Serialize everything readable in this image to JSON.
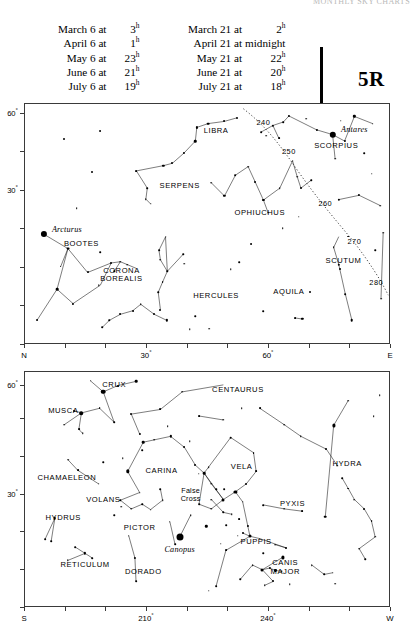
{
  "running_head": "MONTHLY SKY CHARTS",
  "chart_code": "5R",
  "header": {
    "left_column": [
      {
        "label": "March 6 at",
        "value": "3",
        "sup": "h"
      },
      {
        "label": "April 6 at",
        "value": "1",
        "sup": "h"
      },
      {
        "label": "May 6 at",
        "value": "23",
        "sup": "h"
      },
      {
        "label": "June 6 at",
        "value": "21",
        "sup": "h"
      },
      {
        "label": "July 6 at",
        "value": "19",
        "sup": "h"
      }
    ],
    "right_column": [
      {
        "label": "March 21 at",
        "value": "2",
        "sup": "h"
      },
      {
        "label": "April 21 at",
        "value": "midnight",
        "sup": ""
      },
      {
        "label": "May 21 at",
        "value": "22",
        "sup": "h"
      },
      {
        "label": "June 21 at",
        "value": "20",
        "sup": "h"
      },
      {
        "label": "July 21 at",
        "value": "18",
        "sup": "h"
      }
    ]
  },
  "panels": [
    {
      "id": "north",
      "name": "northern-horizon-chart",
      "x_axis": {
        "ticks": [
          {
            "pos": 0.0,
            "label": "N"
          },
          {
            "pos": 0.1111,
            "label": ""
          },
          {
            "pos": 0.2222,
            "label": ""
          },
          {
            "pos": 0.3333,
            "label": "30°"
          },
          {
            "pos": 0.4444,
            "label": ""
          },
          {
            "pos": 0.5555,
            "label": ""
          },
          {
            "pos": 0.6666,
            "label": "60°"
          },
          {
            "pos": 0.7777,
            "label": ""
          },
          {
            "pos": 0.8888,
            "label": ""
          },
          {
            "pos": 1.0,
            "label": "E"
          }
        ]
      },
      "y_axis": {
        "ticks": [
          {
            "pos": 0.0,
            "label": ""
          },
          {
            "pos": 0.16,
            "label": ""
          },
          {
            "pos": 0.32,
            "label": ""
          },
          {
            "pos": 0.48,
            "label": ""
          },
          {
            "pos": 0.64,
            "label": "30°"
          },
          {
            "pos": 0.8,
            "label": ""
          },
          {
            "pos": 0.96,
            "label": "60°"
          }
        ]
      },
      "constellations": [
        {
          "name": "LIBRA",
          "x": 0.525,
          "y": 0.115
        },
        {
          "name": "SCORPIUS",
          "x": 0.855,
          "y": 0.175
        },
        {
          "name": "SERPENS",
          "x": 0.425,
          "y": 0.345
        },
        {
          "name": "OPHIUCHUS",
          "x": 0.645,
          "y": 0.455
        },
        {
          "name": "SCUTUM",
          "x": 0.875,
          "y": 0.655
        },
        {
          "name": "AQUILA",
          "x": 0.725,
          "y": 0.785
        },
        {
          "name": "HERCULES",
          "x": 0.525,
          "y": 0.805
        },
        {
          "name": "CORONA\nBOREALIS",
          "x": 0.265,
          "y": 0.715
        },
        {
          "name": "BOOTES",
          "x": 0.155,
          "y": 0.585
        }
      ],
      "named_stars": [
        {
          "name": "Arcturus",
          "x": 0.115,
          "y": 0.525,
          "star_x": 0.052,
          "star_y": 0.545,
          "size": 6.2
        },
        {
          "name": "Antares",
          "x": 0.905,
          "y": 0.105,
          "star_x": 0.845,
          "star_y": 0.128,
          "size": 6.4
        }
      ],
      "ecliptic_labels": [
        {
          "text": "240",
          "x": 0.655,
          "y": 0.075
        },
        {
          "text": "250",
          "x": 0.725,
          "y": 0.195
        },
        {
          "text": "260",
          "x": 0.825,
          "y": 0.415
        },
        {
          "text": "270",
          "x": 0.905,
          "y": 0.575
        },
        {
          "text": "280",
          "x": 0.965,
          "y": 0.745
        }
      ]
    },
    {
      "id": "south",
      "name": "southern-horizon-chart",
      "x_axis": {
        "ticks": [
          {
            "pos": 0.0,
            "label": "S"
          },
          {
            "pos": 0.1111,
            "label": ""
          },
          {
            "pos": 0.2222,
            "label": ""
          },
          {
            "pos": 0.3333,
            "label": "210°"
          },
          {
            "pos": 0.4444,
            "label": ""
          },
          {
            "pos": 0.5555,
            "label": ""
          },
          {
            "pos": 0.6666,
            "label": "240°"
          },
          {
            "pos": 0.7777,
            "label": ""
          },
          {
            "pos": 0.8888,
            "label": ""
          },
          {
            "pos": 1.0,
            "label": "W"
          }
        ]
      },
      "y_axis": {
        "ticks": [
          {
            "pos": 0.0,
            "label": ""
          },
          {
            "pos": 0.16,
            "label": ""
          },
          {
            "pos": 0.32,
            "label": ""
          },
          {
            "pos": 0.48,
            "label": "30°"
          },
          {
            "pos": 0.64,
            "label": ""
          },
          {
            "pos": 0.8,
            "label": ""
          },
          {
            "pos": 0.94,
            "label": "60°"
          }
        ]
      },
      "constellations": [
        {
          "name": "CRUX",
          "x": 0.245,
          "y": 0.055
        },
        {
          "name": "CENTAURUS",
          "x": 0.585,
          "y": 0.075
        },
        {
          "name": "MUSCA",
          "x": 0.105,
          "y": 0.165
        },
        {
          "name": "VELA",
          "x": 0.595,
          "y": 0.405
        },
        {
          "name": "HYDRA",
          "x": 0.885,
          "y": 0.395
        },
        {
          "name": "CHAMAELEON",
          "x": 0.115,
          "y": 0.455
        },
        {
          "name": "CARINA",
          "x": 0.375,
          "y": 0.425
        },
        {
          "name": "VOLANS",
          "x": 0.215,
          "y": 0.545
        },
        {
          "name": "PYXIS",
          "x": 0.735,
          "y": 0.565
        },
        {
          "name": "PICTOR",
          "x": 0.315,
          "y": 0.665
        },
        {
          "name": "PUPPIS",
          "x": 0.635,
          "y": 0.725
        },
        {
          "name": "HYDRUS",
          "x": 0.105,
          "y": 0.625
        },
        {
          "name": "DORADO",
          "x": 0.325,
          "y": 0.855
        },
        {
          "name": "RETICULUM",
          "x": 0.165,
          "y": 0.825
        },
        {
          "name": "CANIS\nMAJOR",
          "x": 0.715,
          "y": 0.835
        }
      ],
      "named_stars": [
        {
          "name": "Canopus",
          "x": 0.425,
          "y": 0.755,
          "star_x": 0.425,
          "star_y": 0.705,
          "size": 7.0
        }
      ],
      "asterisms": [
        {
          "name": "False\nCross",
          "x": 0.455,
          "y": 0.525
        }
      ],
      "ecliptic_labels": []
    }
  ]
}
